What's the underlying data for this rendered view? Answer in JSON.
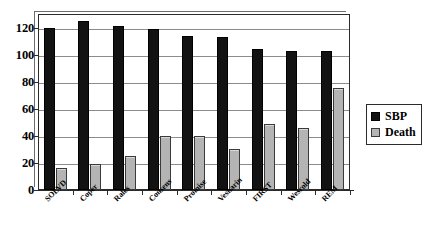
{
  "chart_data": {
    "type": "bar",
    "title": "",
    "xlabel": "",
    "ylabel": "",
    "ylim": [
      0,
      130
    ],
    "yticks": [
      0,
      20,
      40,
      60,
      80,
      100,
      120
    ],
    "ytick_labels": [
      "0",
      "20",
      "40",
      "60",
      "80",
      "100",
      "120"
    ],
    "grid": true,
    "legend_position": "right",
    "categories": [
      "SOLVD",
      "Coper",
      "Rales",
      "Consens",
      "Promise",
      "Vesnarin",
      "FIRST",
      "Wesrold",
      "REM"
    ],
    "series": [
      {
        "name": "SBP",
        "color": "#121212",
        "values": [
          120,
          125,
          121,
          119,
          114,
          113,
          104,
          103,
          103
        ]
      },
      {
        "name": "Death",
        "color": "#b4b4b4",
        "values": [
          16,
          19,
          25,
          40,
          40,
          30,
          49,
          46,
          75
        ]
      }
    ]
  },
  "legend": {
    "items": [
      {
        "label": "SBP",
        "color": "#121212"
      },
      {
        "label": "Death",
        "color": "#b4b4b4"
      }
    ]
  }
}
